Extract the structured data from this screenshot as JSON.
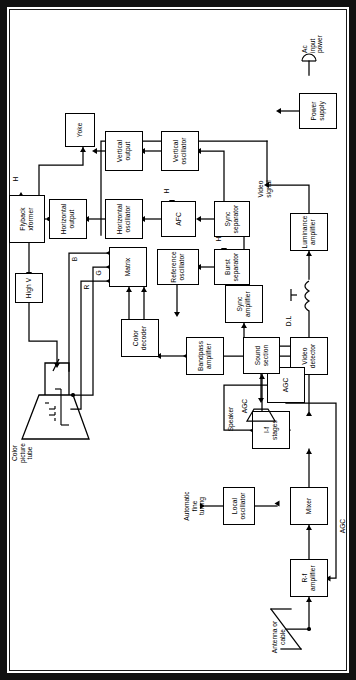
{
  "figure": {
    "type": "block-diagram",
    "orientation": "rotated-90-ccw",
    "line_color": "#000000",
    "background": "#ffffff"
  },
  "blocks": {
    "rf_amplifier": "R-f\namplifier",
    "mixer": "Mixer",
    "local_oscillator": "Local\noscillator",
    "if_stages": "I-f\nstages",
    "video_detector": "Video\ndetector",
    "sound_section": "Sound\nsection",
    "luminance_amplifier": "Luminance\namplifier",
    "bandpass_amplifier": "Bandpass\namplifier",
    "color_decoder": "Color\ndecoder",
    "reference_oscillator": "Reference\noscillator",
    "matrix": "Matrix",
    "agc": "AGC",
    "sync_amplifier": "Sync\namplifier",
    "burst_separator": "Burst\nseparator",
    "sync_separator": "Sync\nseparator",
    "afc": "AFC",
    "horizontal_oscillator": "Horizontal\noscillator",
    "horizontal_output": "Horizontal\noutput",
    "flyback_transformer": "Flyback\nxformer",
    "high_v": "High V",
    "yoke": "Yoke",
    "vertical_oscillator": "Vertical\noscillator",
    "vertical_output": "Vertical\noutput",
    "power_supply": "Power\nsupply"
  },
  "labels": {
    "antenna": "Antenna or\ncable",
    "speaker": "Speaker",
    "delay_line": "D.L",
    "video_signal": "Video\nsignal",
    "color_picture_tube": "Color\npicture\ntube",
    "automatic_fine_tuning": "Automatic\nfine\ntuning",
    "agc_line_rf": "AGC",
    "agc_line_if": "AGC",
    "ac_input_power": "Ac\ninput\npower",
    "gun_r": "R",
    "gun_g": "G",
    "gun_b": "B",
    "h_agc": "H",
    "h_burst": "H",
    "h_afc": "H",
    "h_flyback": "H"
  }
}
